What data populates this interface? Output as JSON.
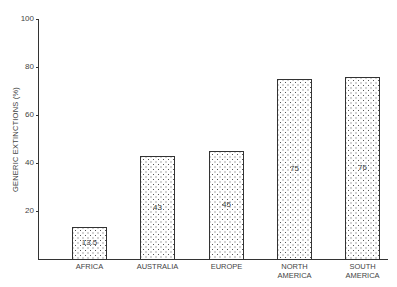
{
  "chart_data": {
    "type": "bar",
    "title": "",
    "xlabel": "",
    "ylabel": "GENERIC EXTINCTIONS (%)",
    "ylim": [
      0,
      100
    ],
    "yticks": [
      20,
      40,
      60,
      80,
      100
    ],
    "grid": false,
    "categories": [
      "AFRICA",
      "AUSTRALIA",
      "EUROPE",
      "NORTH AMERICA",
      "SOUTH AMERICA"
    ],
    "category_lines": [
      [
        "AFRICA"
      ],
      [
        "AUSTRALIA"
      ],
      [
        "EUROPE"
      ],
      [
        "NORTH",
        "AMERICA"
      ],
      [
        "SOUTH",
        "AMERICA"
      ]
    ],
    "values": [
      13.5,
      43,
      45,
      75,
      76
    ],
    "value_labels": [
      "13.5",
      "43",
      "45",
      "75",
      "76"
    ],
    "fill": "stippled dots"
  }
}
